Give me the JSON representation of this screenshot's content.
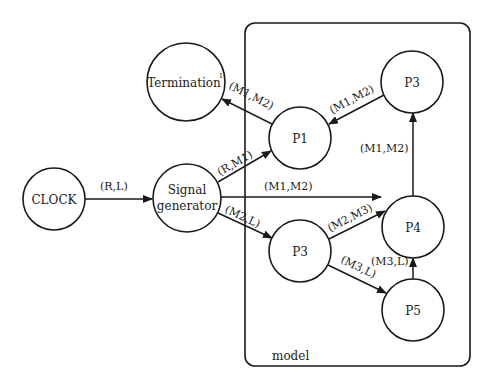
{
  "diagram": {
    "container": {
      "label": "model"
    },
    "nodes": {
      "clock": {
        "label": "CLOCK"
      },
      "signal_generator": {
        "label_line1": "Signal",
        "label_line2": "generator"
      },
      "termination": {
        "label": "Termination",
        "superscript": "1"
      },
      "p1": {
        "label": "P1"
      },
      "p3_top": {
        "label": "P3"
      },
      "p4": {
        "label": "P4"
      },
      "p3_mid": {
        "label": "P3"
      },
      "p5": {
        "label": "P5"
      }
    },
    "edges": [
      {
        "from": "CLOCK",
        "to": "Signal generator",
        "label": "(R,L)"
      },
      {
        "from": "Signal generator",
        "to": "P1",
        "label": "(R,M1)"
      },
      {
        "from": "Signal generator",
        "to": "P4",
        "label": "(M1,M2)"
      },
      {
        "from": "Signal generator",
        "to": "P3",
        "label": "(M2,L)"
      },
      {
        "from": "P1",
        "to": "Termination",
        "label": "(M1,M2)"
      },
      {
        "from": "P3 (top)",
        "to": "P1",
        "label": "(M1,M2)"
      },
      {
        "from": "P4",
        "to": "P3 (top)",
        "label": "(M1,M2)"
      },
      {
        "from": "P3",
        "to": "P4",
        "label": "(M2,M3)"
      },
      {
        "from": "P3",
        "to": "P5",
        "label": "(M3,L)"
      },
      {
        "from": "P5",
        "to": "P4",
        "label": "(M3,L)"
      }
    ]
  },
  "colors": {
    "stroke": "#1a1a1a",
    "background": "#ffffff"
  }
}
